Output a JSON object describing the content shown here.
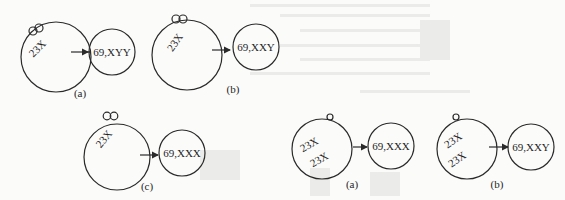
{
  "figure": {
    "type": "polyploidy-fertilization-diagrams",
    "panels": [
      {
        "id": "top-a",
        "label": "(a)",
        "egg_chromosomes": [
          "23X"
        ],
        "sperm_count": 2,
        "result": "69,XYY"
      },
      {
        "id": "top-b",
        "label": "(b)",
        "egg_chromosomes": [
          "23X"
        ],
        "sperm_count": 2,
        "result": "69,XXY"
      },
      {
        "id": "top-c",
        "label": "(c)",
        "egg_chromosomes": [
          "23X"
        ],
        "sperm_count": 2,
        "result": "69,XXX"
      },
      {
        "id": "bottom-a",
        "label": "(a)",
        "egg_chromosomes": [
          "23X",
          "23X"
        ],
        "sperm_count": 1,
        "result": "69,XXX"
      },
      {
        "id": "bottom-b",
        "label": "(b)",
        "egg_chromosomes": [
          "23X",
          "23X"
        ],
        "sperm_count": 1,
        "result": "69,XXY"
      }
    ]
  },
  "colors": {
    "ink": "#2a2a2a",
    "paper": "#fbfbfa",
    "bleed_through": "#e6e6e4"
  }
}
